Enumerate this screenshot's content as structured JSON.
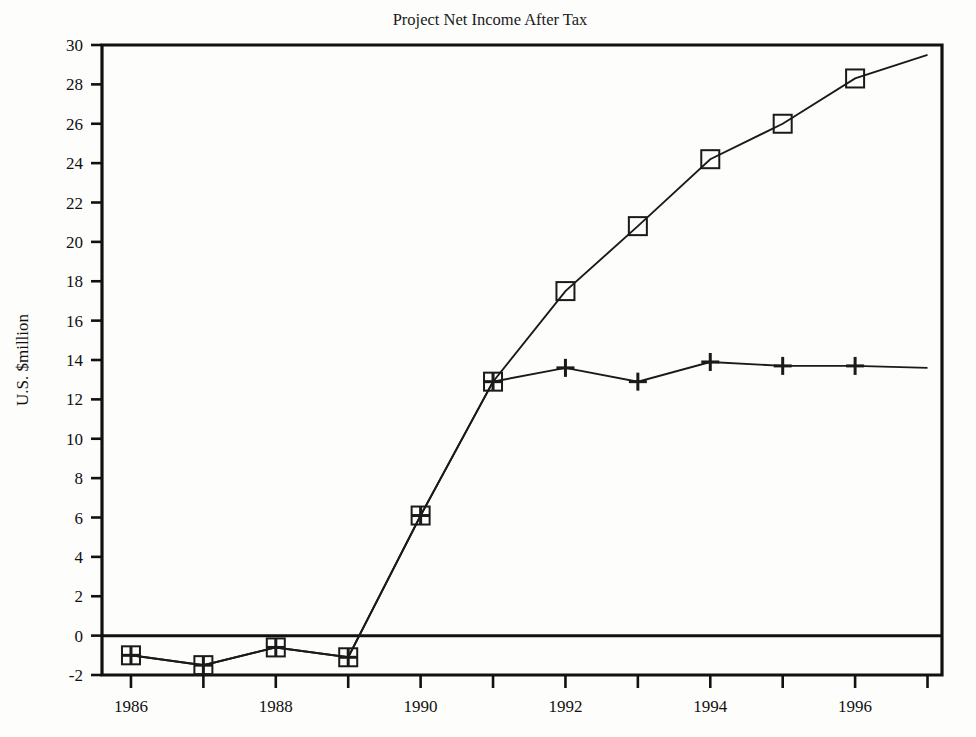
{
  "figure": {
    "background_color": "#fdfdfc",
    "ink_color": "#1a1a1a"
  },
  "chart_data": {
    "type": "line",
    "title": "Project Net Income After Tax",
    "xlabel": "",
    "ylabel": "U.S. $million",
    "x": [
      1986,
      1987,
      1988,
      1989,
      1990,
      1991,
      1992,
      1993,
      1994,
      1995,
      1996,
      1997
    ],
    "xlim": [
      1985.6,
      1997.2
    ],
    "ylim": [
      -2,
      30
    ],
    "xtick_values": [
      1986,
      1987,
      1988,
      1989,
      1990,
      1991,
      1992,
      1993,
      1994,
      1995,
      1996,
      1997
    ],
    "xtick_labels": [
      "1986",
      "",
      "1988",
      "",
      "1990",
      "",
      "1992",
      "",
      "1994",
      "",
      "1996",
      ""
    ],
    "ytick_values": [
      -2,
      0,
      2,
      4,
      6,
      8,
      10,
      12,
      14,
      16,
      18,
      20,
      22,
      24,
      26,
      28,
      30
    ],
    "ytick_labels": [
      "-2",
      "0",
      "2",
      "4",
      "6",
      "8",
      "10",
      "12",
      "14",
      "16",
      "18",
      "20",
      "22",
      "24",
      "26",
      "28",
      "30"
    ],
    "grid": false,
    "legend": "none",
    "zero_line": 0,
    "series": [
      {
        "name": "series-square",
        "marker": "square",
        "values": [
          -1.0,
          -1.5,
          -0.6,
          -1.1,
          6.1,
          12.9,
          17.5,
          20.8,
          24.2,
          26.0,
          28.3,
          29.5
        ],
        "marker_at_last_point": false
      },
      {
        "name": "series-plus",
        "marker": "plus",
        "values": [
          -1.0,
          -1.5,
          -0.6,
          -1.1,
          6.1,
          12.9,
          13.6,
          12.9,
          13.9,
          13.7,
          13.7,
          13.6
        ],
        "marker_at_last_point": false
      }
    ]
  }
}
